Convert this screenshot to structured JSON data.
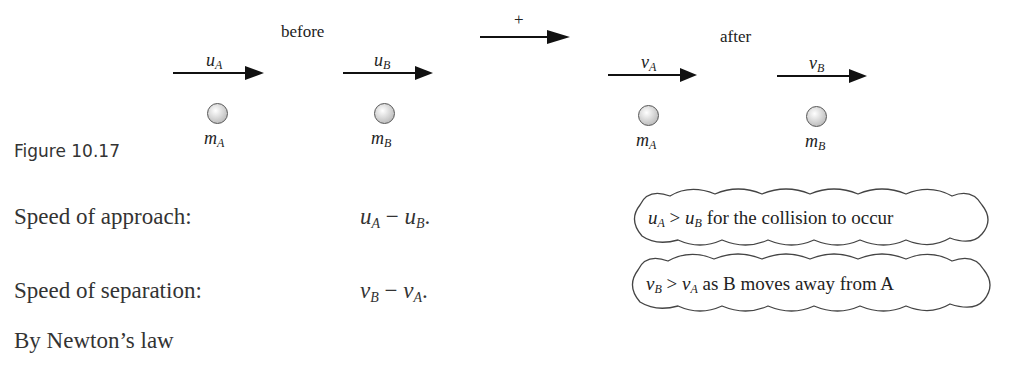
{
  "figure": {
    "caption": "Figure 10.17",
    "before_label": "before",
    "after_label": "after",
    "positive_direction_label": "+",
    "before": [
      {
        "velocity": "u",
        "velocity_sub": "A",
        "mass": "m",
        "mass_sub": "A"
      },
      {
        "velocity": "u",
        "velocity_sub": "B",
        "mass": "m",
        "mass_sub": "B"
      }
    ],
    "after": [
      {
        "velocity": "v",
        "velocity_sub": "A",
        "mass": "m",
        "mass_sub": "A"
      },
      {
        "velocity": "v",
        "velocity_sub": "B",
        "mass": "m",
        "mass_sub": "B"
      }
    ]
  },
  "text": {
    "approach_label": "Speed of approach:",
    "approach_expr": {
      "a": "u",
      "a_sub": "A",
      "op": " − ",
      "b": "u",
      "b_sub": "B",
      "end": "."
    },
    "separation_label": "Speed of separation:",
    "separation_expr": {
      "a": "v",
      "a_sub": "B",
      "op": " − ",
      "b": "v",
      "b_sub": "A",
      "end": "."
    },
    "newton": "By Newton’s law"
  },
  "notes": [
    {
      "a": "u",
      "a_sub": "A",
      "op": " > ",
      "b": "u",
      "b_sub": "B",
      "rest": " for the collision to occur"
    },
    {
      "a": "v",
      "a_sub": "B",
      "op": " > ",
      "b": "v",
      "b_sub": "A",
      "rest": " as B moves away from A"
    }
  ]
}
